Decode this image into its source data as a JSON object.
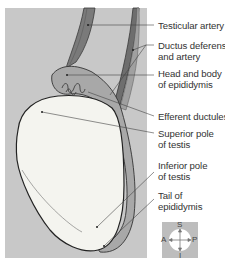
{
  "figure": {
    "background_color": "#c8c8c8",
    "testis_color": "#f4f4ef",
    "epididymis_color": "#a8a8a8",
    "vessel_color": "#6e6e6e"
  },
  "labels": [
    {
      "id": "testicular-artery",
      "lines": [
        "Testicular artery"
      ]
    },
    {
      "id": "ductus-deferens",
      "lines": [
        "Ductus deferens",
        "and artery"
      ]
    },
    {
      "id": "head-body-epididymis",
      "lines": [
        "Head and body",
        "of epididymis"
      ]
    },
    {
      "id": "efferent-ductules",
      "lines": [
        "Efferent ductules"
      ]
    },
    {
      "id": "superior-pole",
      "lines": [
        "Superior pole",
        "of testis"
      ]
    },
    {
      "id": "inferior-pole",
      "lines": [
        "Inferior pole",
        "of testis"
      ]
    },
    {
      "id": "tail-epididymis",
      "lines": [
        "Tail of",
        "epididymis"
      ]
    }
  ],
  "compass": {
    "top": "S",
    "bottom": "I",
    "left": "A",
    "right": "P"
  }
}
